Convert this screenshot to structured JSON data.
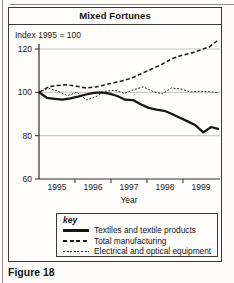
{
  "figure": {
    "caption": "Figure 18",
    "title": "Mixed Fortunes",
    "index_label": "Index 1995 = 100",
    "xlabel": "Year",
    "key_title": "key"
  },
  "colors": {
    "ink": "#1c1c1c",
    "grid": "#b5b3af",
    "axis": "#2f2e2c"
  },
  "chart_data": {
    "type": "line",
    "title": "Mixed Fortunes",
    "subtitle": "Index 1995 = 100",
    "xlabel": "Year",
    "x_categories": [
      "1995",
      "1996",
      "1997",
      "1998",
      "1999"
    ],
    "ylim": [
      60,
      120
    ],
    "yticks": [
      60,
      80,
      100,
      120
    ],
    "grid": "horizontal",
    "legend_position": "bottom-box",
    "series": [
      {
        "name": "Textiles and textile products",
        "line_style": "solid",
        "values": [
          100,
          97.5,
          97,
          96.6,
          97.2,
          98,
          99,
          99.8,
          100,
          99.4,
          98.3,
          96.6,
          96.4,
          94.5,
          92.8,
          92,
          91.5,
          90,
          88.3,
          86.6,
          84.8,
          81.5,
          84,
          83
        ]
      },
      {
        "name": "Total manufacturing",
        "line_style": "dashed",
        "values": [
          100,
          102.5,
          103.2,
          103.5,
          102.8,
          102,
          102.5,
          103.5,
          104.5,
          105.5,
          107,
          109,
          111,
          113,
          115.5,
          117,
          118,
          119.5,
          121,
          124.5
        ]
      },
      {
        "name": "Electrical and optical equipment",
        "line_style": "fine-dashed",
        "values": [
          100,
          102,
          100.5,
          98.5,
          100,
          96.5,
          98,
          100.5,
          101,
          99.5,
          101.2,
          102.5,
          100.5,
          99.3,
          102,
          101.5,
          100.2,
          100.5,
          100.3,
          99.8
        ]
      }
    ]
  }
}
